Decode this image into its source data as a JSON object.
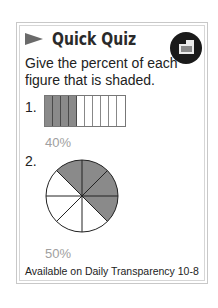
{
  "card": {
    "title": "Quick Quiz",
    "badge_icon": "transparency-icon",
    "prompt": "Give the percent of each figure that is shaded.",
    "footer": "Available on Daily Transparency 10-8"
  },
  "questions": [
    {
      "number": "1.",
      "figure": "bar",
      "total_parts": 10,
      "shaded_parts": 4,
      "answer": "40%"
    },
    {
      "number": "2.",
      "figure": "circle",
      "total_parts": 8,
      "shaded_parts": 4,
      "answer": "50%"
    }
  ],
  "colors": {
    "shaded": "#8a8a8a",
    "answer_text": "#a0a0a0",
    "border": "#c8c8c8"
  }
}
